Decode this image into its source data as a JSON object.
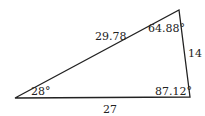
{
  "diagram": {
    "type": "triangle",
    "stroke_color": "#222222",
    "vertices": {
      "A": {
        "x": 15,
        "y": 98
      },
      "B": {
        "x": 179,
        "y": 10
      },
      "C": {
        "x": 190,
        "y": 97
      }
    },
    "sides": {
      "AB": "29.78",
      "BC": "14",
      "AC": "27"
    },
    "angles": {
      "A": "28°",
      "B": "64.88°",
      "C": "87.12°"
    }
  }
}
